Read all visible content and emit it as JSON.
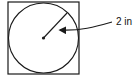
{
  "diagram": {
    "type": "circle-inscribed-in-square",
    "square": {
      "x": 8,
      "y": 2,
      "width": 71,
      "height": 72
    },
    "circle": {
      "cx": 43.5,
      "cy": 38,
      "r": 35
    },
    "radius_line": {
      "x1": 43.5,
      "y1": 38,
      "x2": 67,
      "y2": 13
    },
    "center_dot": {
      "cx": 43.5,
      "cy": 38,
      "r": 1.6
    },
    "annotation": {
      "label": "2 in",
      "refers_to": "radius",
      "arrow_path": "M 112 22 C 95 27, 80 31, 60 30"
    },
    "stroke_color": "#1a1a1a",
    "background": "#ffffff"
  }
}
